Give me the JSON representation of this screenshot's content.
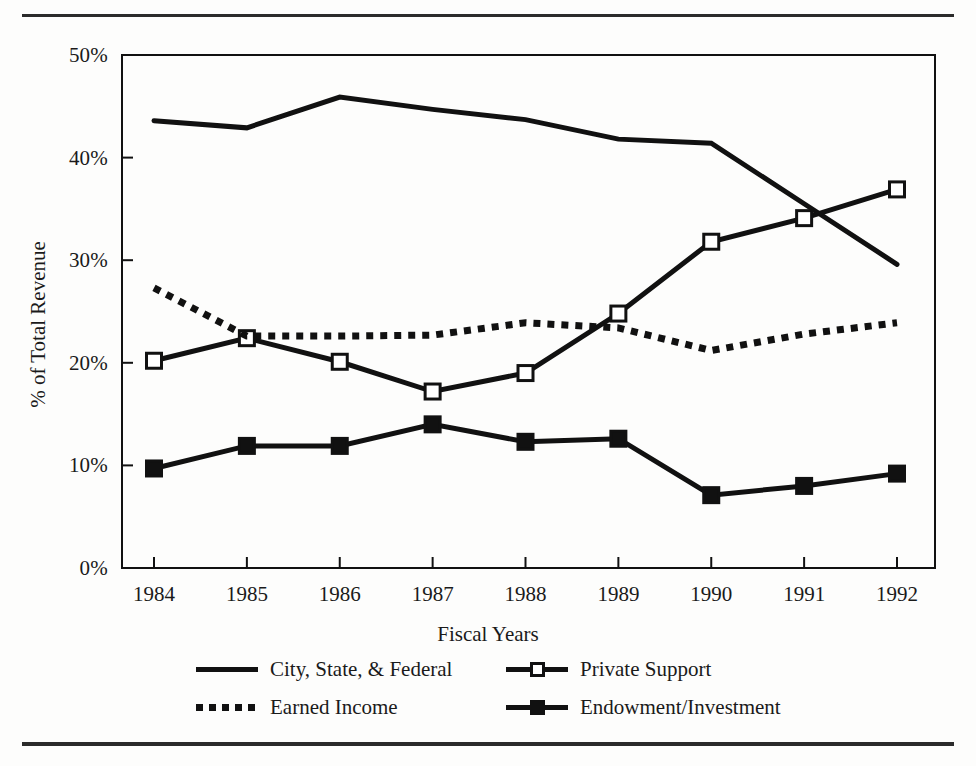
{
  "chart_data": {
    "type": "line",
    "title": "",
    "xlabel": "Fiscal Years",
    "ylabel": "% of Total Revenue",
    "categories": [
      "1984",
      "1985",
      "1986",
      "1987",
      "1988",
      "1989",
      "1990",
      "1991",
      "1992"
    ],
    "ylim": [
      0,
      50
    ],
    "yticks": [
      0,
      10,
      20,
      30,
      40,
      50
    ],
    "ytick_labels": [
      "0%",
      "10%",
      "20%",
      "30%",
      "40%",
      "50%"
    ],
    "grid": false,
    "legend_position": "bottom",
    "series": [
      {
        "name": "City, State, & Federal",
        "style": "solid",
        "marker": "none",
        "color": "#111111",
        "values": [
          43.6,
          42.9,
          45.9,
          44.7,
          43.7,
          41.8,
          41.4,
          35.5,
          29.6
        ]
      },
      {
        "name": "Private Support",
        "style": "solid",
        "marker": "open-square",
        "color": "#111111",
        "values": [
          20.2,
          22.4,
          20.1,
          17.2,
          19.0,
          24.8,
          31.8,
          34.1,
          36.9
        ]
      },
      {
        "name": "Earned Income",
        "style": "dotted",
        "marker": "none",
        "color": "#111111",
        "values": [
          27.3,
          22.6,
          22.6,
          22.7,
          23.9,
          23.4,
          21.2,
          22.8,
          23.9
        ]
      },
      {
        "name": "Endowment/Investment",
        "style": "solid",
        "marker": "filled-square",
        "color": "#111111",
        "values": [
          9.7,
          11.9,
          11.9,
          14.0,
          12.3,
          12.6,
          7.1,
          8.0,
          9.2
        ]
      }
    ]
  },
  "legend": {
    "items": [
      {
        "label": "City, State, & Federal",
        "style": "solid",
        "marker": "none"
      },
      {
        "label": "Private Support",
        "style": "solid",
        "marker": "open-square"
      },
      {
        "label": "Earned Income",
        "style": "dotted",
        "marker": "none"
      },
      {
        "label": "Endowment/Investment",
        "style": "solid",
        "marker": "filled-square"
      }
    ]
  },
  "colors": {
    "ink": "#111111",
    "rule": "#2b2b2b",
    "page": "#fdfdfc"
  }
}
